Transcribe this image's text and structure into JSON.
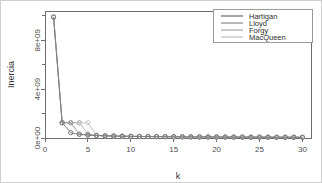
{
  "chart_data": {
    "type": "line",
    "title": "",
    "xlabel": "k",
    "ylabel": "Inercia",
    "xlim": [
      0,
      31
    ],
    "ylim": [
      0,
      10400000000
    ],
    "grid": false,
    "legend_position": "top-right",
    "x": [
      1,
      2,
      3,
      4,
      5,
      6,
      7,
      8,
      9,
      10,
      11,
      12,
      13,
      14,
      15,
      16,
      17,
      18,
      19,
      20,
      21,
      22,
      23,
      24,
      25,
      26,
      27,
      28,
      29,
      30
    ],
    "xticks": [
      "0",
      "5",
      "10",
      "15",
      "20",
      "25",
      "30"
    ],
    "xtick_values": [
      0,
      5,
      10,
      15,
      20,
      25,
      30
    ],
    "yticks": [
      "0e+00",
      "4e+09",
      "8e+09"
    ],
    "ytick_values": [
      0,
      4000000000,
      8000000000
    ],
    "series": [
      {
        "name": "Hartigan",
        "color": "#7f7f7f",
        "values": [
          9900000000,
          1250000000,
          430000000,
          300000000,
          240000000,
          200000000,
          175000000,
          158000000,
          145000000,
          134000000,
          125000000,
          117000000,
          110000000,
          104000000,
          99000000,
          94000000,
          90000000,
          86000000,
          83000000,
          80000000,
          77000000,
          74000000,
          72000000,
          70000000,
          68000000,
          66000000,
          64000000,
          62000000,
          61000000,
          59000000
        ]
      },
      {
        "name": "Lloyd",
        "color": "#9a9a9a",
        "values": [
          9900000000,
          1250000000,
          1250000000,
          320000000,
          250000000,
          205000000,
          178000000,
          160000000,
          147000000,
          136000000,
          127000000,
          119000000,
          112000000,
          106000000,
          100000000,
          95000000,
          91000000,
          87000000,
          84000000,
          81000000,
          78000000,
          75000000,
          73000000,
          71000000,
          69000000,
          67000000,
          65000000,
          63000000,
          62000000,
          60000000
        ]
      },
      {
        "name": "Forgy",
        "color": "#b5b5b5",
        "values": [
          9900000000,
          1250000000,
          1250000000,
          1250000000,
          330000000,
          215000000,
          182000000,
          163000000,
          150000000,
          138000000,
          129000000,
          121000000,
          114000000,
          108000000,
          102000000,
          97000000,
          92000000,
          88000000,
          85000000,
          82000000,
          79000000,
          76000000,
          74000000,
          72000000,
          70000000,
          68000000,
          66000000,
          64000000,
          63000000,
          61000000
        ]
      },
      {
        "name": "MacQueen",
        "color": "#c9c9c9",
        "values": [
          9900000000,
          1250000000,
          1250000000,
          1250000000,
          1250000000,
          225000000,
          186000000,
          166000000,
          152000000,
          140000000,
          131000000,
          123000000,
          116000000,
          110000000,
          104000000,
          99000000,
          94000000,
          90000000,
          87000000,
          84000000,
          81000000,
          78000000,
          76000000,
          74000000,
          72000000,
          70000000,
          68000000,
          66000000,
          65000000,
          63000000
        ]
      }
    ]
  },
  "legend": {
    "entries": [
      {
        "label": "Hartigan"
      },
      {
        "label": "Lloyd"
      },
      {
        "label": "Forgy"
      },
      {
        "label": "MacQueen"
      }
    ]
  },
  "axes": {
    "x_title": "k",
    "y_title": "Inercia"
  }
}
